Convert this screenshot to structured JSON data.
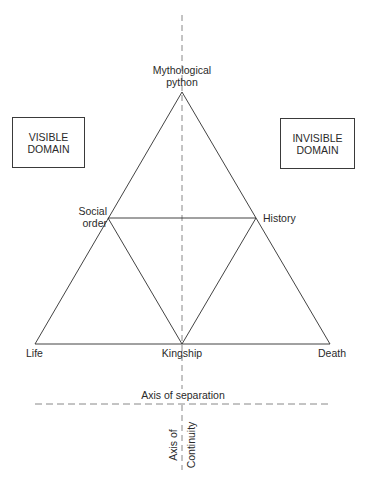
{
  "diagram": {
    "type": "triangular structural diagram",
    "domains": {
      "left_box": "VISIBLE\nDOMAIN",
      "right_box": "INVISIBLE\nDOMAIN"
    },
    "nodes": {
      "apex": "Mythological\npython",
      "mid_left": "Social\norder",
      "mid_right": "History",
      "bottom_left": "Life",
      "bottom_center": "Kingship",
      "bottom_right": "Death"
    },
    "axes": {
      "horizontal": "Axis of separation",
      "vertical_part1": "Axis of",
      "vertical_part2": "Continuity"
    },
    "edges": [
      [
        "apex",
        "bottom_left"
      ],
      [
        "apex",
        "bottom_right"
      ],
      [
        "bottom_left",
        "bottom_right"
      ],
      [
        "mid_left",
        "mid_right"
      ],
      [
        "mid_left",
        "bottom_center"
      ],
      [
        "mid_right",
        "bottom_center"
      ]
    ],
    "line_color": "#2e2e2e",
    "dash_color": "#7a7a7a"
  }
}
